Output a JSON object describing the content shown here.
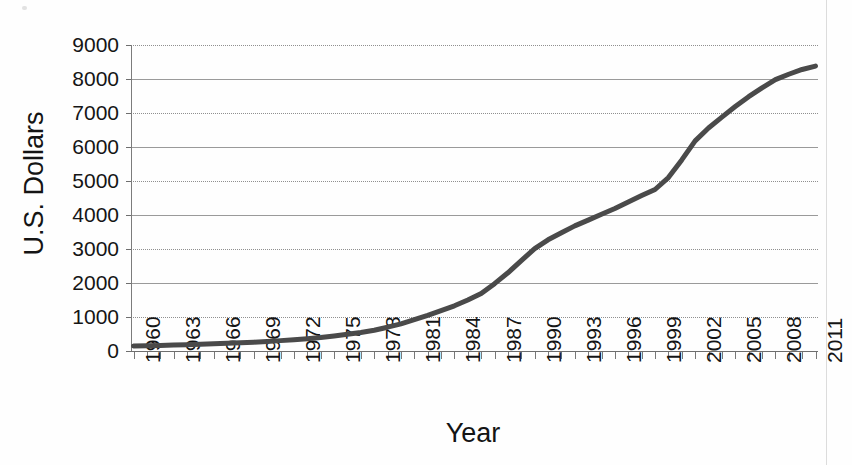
{
  "figure": {
    "background_color": "#fefefe",
    "line_color": "#4a4a4a",
    "grid_color": "#9a9a9a",
    "axis_color": "#6e6e6e"
  },
  "chart_data": {
    "type": "line",
    "title": "",
    "xlabel": "Year",
    "ylabel": "U.S. Dollars",
    "xlim": [
      1960,
      2011
    ],
    "ylim": [
      0,
      9000
    ],
    "grid": true,
    "legend": "none",
    "ytick_labels": [
      "9000",
      "8000",
      "7000",
      "6000",
      "5000",
      "4000",
      "3000",
      "2000",
      "1000",
      "0"
    ],
    "ytick_values": [
      9000,
      8000,
      7000,
      6000,
      5000,
      4000,
      3000,
      2000,
      1000,
      0
    ],
    "xtick_labels": [
      "1960",
      "1963",
      "1966",
      "1969",
      "1972",
      "1975",
      "1978",
      "1981",
      "1984",
      "1987",
      "1990",
      "1993",
      "1996",
      "1999",
      "2002",
      "2005",
      "2008",
      "2011"
    ],
    "x": [
      1960,
      1961,
      1962,
      1963,
      1964,
      1965,
      1966,
      1967,
      1968,
      1969,
      1970,
      1971,
      1972,
      1973,
      1974,
      1975,
      1976,
      1977,
      1978,
      1979,
      1980,
      1981,
      1982,
      1983,
      1984,
      1985,
      1986,
      1987,
      1988,
      1989,
      1990,
      1991,
      1992,
      1993,
      1994,
      1995,
      1996,
      1997,
      1998,
      1999,
      2000,
      2001,
      2002,
      2003,
      2004,
      2005,
      2006,
      2007,
      2008,
      2009,
      2010,
      2011
    ],
    "values": [
      150,
      155,
      165,
      175,
      185,
      195,
      210,
      225,
      240,
      260,
      280,
      305,
      330,
      360,
      395,
      440,
      490,
      545,
      610,
      700,
      800,
      920,
      1050,
      1190,
      1330,
      1500,
      1690,
      1980,
      2300,
      2660,
      3010,
      3270,
      3480,
      3680,
      3850,
      4020,
      4190,
      4380,
      4570,
      4750,
      5100,
      5620,
      6180,
      6560,
      6880,
      7190,
      7480,
      7740,
      7980,
      8140,
      8280,
      8380
    ],
    "series_name": "U.S. Dollars"
  }
}
